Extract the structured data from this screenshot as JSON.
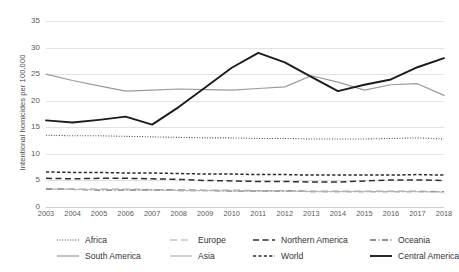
{
  "chart_data": {
    "type": "line",
    "title": "",
    "xlabel": "",
    "ylabel": "Intentional homicides per 100,000",
    "ylim": [
      0,
      35
    ],
    "yticks": [
      0,
      5,
      10,
      15,
      20,
      25,
      30,
      35
    ],
    "grid": true,
    "legend_position": "bottom",
    "legend_columns": 4,
    "categories": [
      "2003",
      "2004",
      "2005",
      "2006",
      "2007",
      "2008",
      "2009",
      "2010",
      "2011",
      "2012",
      "2013",
      "2014",
      "2015",
      "2016",
      "2017",
      "2018"
    ],
    "x": [
      2003,
      2004,
      2005,
      2006,
      2007,
      2008,
      2009,
      2010,
      2011,
      2012,
      2013,
      2014,
      2015,
      2016,
      2017,
      2018
    ],
    "series": [
      {
        "name": "Africa",
        "style": "dotted",
        "color": "#3a3a3a",
        "values": [
          13.5,
          13.4,
          13.4,
          13.3,
          13.2,
          13.1,
          13.0,
          13.0,
          12.9,
          12.9,
          12.8,
          12.8,
          12.8,
          12.9,
          13.0,
          12.8
        ]
      },
      {
        "name": "Europe",
        "style": "long-dash",
        "color": "#a8a8a8",
        "values": [
          3.5,
          3.4,
          3.4,
          3.4,
          3.3,
          3.3,
          3.2,
          3.2,
          3.1,
          3.1,
          3.0,
          3.0,
          3.0,
          3.0,
          3.0,
          2.9
        ]
      },
      {
        "name": "Northern America",
        "style": "dash",
        "color": "#2f2f2f",
        "values": [
          5.4,
          5.3,
          5.4,
          5.4,
          5.3,
          5.2,
          5.0,
          4.9,
          4.8,
          4.8,
          4.7,
          4.7,
          4.9,
          5.1,
          5.1,
          5.0
        ]
      },
      {
        "name": "Oceania",
        "style": "dash-dot",
        "color": "#6e6e6e",
        "values": [
          3.3,
          3.3,
          3.2,
          3.2,
          3.2,
          3.1,
          3.1,
          3.0,
          3.0,
          3.0,
          2.9,
          2.9,
          2.9,
          2.9,
          2.9,
          2.9
        ]
      },
      {
        "name": "South America",
        "style": "solid",
        "color": "#9a9a9a",
        "values": [
          25.0,
          23.8,
          22.8,
          21.8,
          22.0,
          22.2,
          22.1,
          22.0,
          22.3,
          22.6,
          24.7,
          23.5,
          22.0,
          23.0,
          23.2,
          21.0
        ]
      },
      {
        "name": "Asia",
        "style": "solid-thin",
        "color": "#b5b5b5",
        "values": [
          3.4,
          3.3,
          3.3,
          3.2,
          3.2,
          3.1,
          3.1,
          3.0,
          3.0,
          3.0,
          2.9,
          2.9,
          2.9,
          2.9,
          2.9,
          2.8
        ]
      },
      {
        "name": "World",
        "style": "short-dash",
        "color": "#2b2b2b",
        "values": [
          6.6,
          6.5,
          6.5,
          6.4,
          6.4,
          6.3,
          6.2,
          6.2,
          6.1,
          6.1,
          6.0,
          6.0,
          6.0,
          6.0,
          6.1,
          6.0
        ]
      },
      {
        "name": "Central America",
        "style": "solid-bold",
        "color": "#1c1c1c",
        "values": [
          16.3,
          15.9,
          16.4,
          17.0,
          15.5,
          18.8,
          22.5,
          26.2,
          29.0,
          27.2,
          24.5,
          21.8,
          23.0,
          24.0,
          26.3,
          28.0
        ]
      }
    ]
  },
  "axes": {
    "y_tick_labels": [
      "35",
      "30",
      "25",
      "20",
      "15",
      "10",
      "5",
      "0"
    ],
    "x_tick_labels": [
      "2003",
      "2004",
      "2005",
      "2006",
      "2007",
      "2008",
      "2009",
      "2010",
      "2011",
      "2012",
      "2013",
      "2014",
      "2015",
      "2016",
      "2017",
      "2018"
    ],
    "y_axis_title": "Intentional homicides per 100,000"
  },
  "legend": {
    "row1": [
      {
        "label": "Africa"
      },
      {
        "label": "Europe"
      },
      {
        "label": "Northern America"
      },
      {
        "label": "Oceania"
      }
    ],
    "row2": [
      {
        "label": "South America"
      },
      {
        "label": "Asia"
      },
      {
        "label": "World"
      },
      {
        "label": "Central America"
      }
    ]
  }
}
